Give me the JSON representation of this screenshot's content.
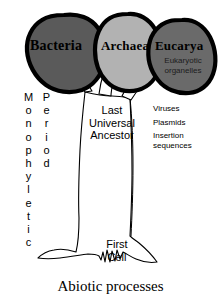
{
  "figure": {
    "background_color": "#ffffff",
    "outline_color": "#000000"
  },
  "domains": [
    {
      "id": "bacteria",
      "label": "Bacteria",
      "fill_color": "#5a5a5a",
      "outline_color": "#000000"
    },
    {
      "id": "archaea",
      "label": "Archaea",
      "fill_color": "#b2b2b2",
      "outline_color": "#000000"
    },
    {
      "id": "eucarya",
      "label": "Eucarya",
      "sublabel": "Eukaryotic\norganelles",
      "fill_color": "#6a6a6a",
      "outline_color": "#000000"
    }
  ],
  "vertical_labels": {
    "monophyletic": "Monophyletic",
    "period": "Period"
  },
  "trunk": {
    "luca_label": "Last\nUniversal\nAncestor",
    "first_cell_label": "First\nCell"
  },
  "annotations": {
    "mobile_elements": [
      "Viruses",
      "Plasmids",
      "Insertion\nsequences"
    ]
  },
  "footer": {
    "abiotic_label": "Abiotic processes"
  }
}
